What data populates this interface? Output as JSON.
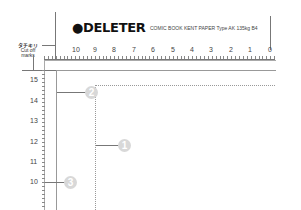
{
  "brand": {
    "logo": "DELETER",
    "logo_icon": "cat-head-icon",
    "subtitle": "COMIC BOOK KENT PAPER Type AK 135kg B4"
  },
  "cut_marks_label": {
    "japanese": "タチキリ",
    "english_line1": "Cut off",
    "english_line2": "marks"
  },
  "top_ruler": {
    "numbers": [
      "10",
      "9",
      "8",
      "7",
      "6",
      "5",
      "4",
      "3",
      "2",
      "1",
      "0"
    ]
  },
  "left_ruler": {
    "numbers": [
      "15",
      "14",
      "13",
      "12",
      "11",
      "10"
    ]
  },
  "callouts": [
    {
      "id": "1",
      "label": "1"
    },
    {
      "id": "2",
      "label": "2"
    },
    {
      "id": "3",
      "label": "3"
    }
  ],
  "colors": {
    "badge": "#d8d8d8",
    "line": "#777777",
    "dotted": "#999999"
  }
}
